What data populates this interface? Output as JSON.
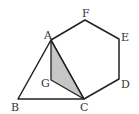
{
  "figure": {
    "colors": {
      "stroke": "#222222",
      "shade": "#c6c6c6",
      "label": "#333333"
    },
    "points": {
      "A": {
        "label": "A",
        "x": 51,
        "y": 40,
        "lx": 44,
        "ly": 39
      },
      "B": {
        "label": "B",
        "x": 18,
        "y": 99,
        "lx": 11,
        "ly": 111
      },
      "C": {
        "label": "C",
        "x": 84,
        "y": 99,
        "lx": 80,
        "ly": 111
      },
      "D": {
        "label": "D",
        "x": 119,
        "y": 79,
        "lx": 121,
        "ly": 88
      },
      "E": {
        "label": "E",
        "x": 119,
        "y": 39,
        "lx": 121,
        "ly": 41
      },
      "F": {
        "label": "F",
        "x": 85,
        "y": 20,
        "lx": 82,
        "ly": 17
      },
      "G": {
        "label": "G",
        "x": 51,
        "y": 80,
        "lx": 41,
        "ly": 87
      }
    },
    "hexagon": [
      "A",
      "F",
      "E",
      "D",
      "C"
    ],
    "triangle": [
      "A",
      "B",
      "C"
    ],
    "shaded_triangle": [
      "A",
      "G",
      "C"
    ]
  }
}
